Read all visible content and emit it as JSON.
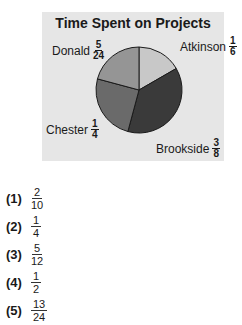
{
  "chart_data": {
    "type": "pie",
    "title": "Time Spent on Projects",
    "slices": [
      {
        "label": "Atkinson",
        "fraction": "1/6",
        "value": 0.1667,
        "color": "#c8c8c8"
      },
      {
        "label": "Brookside",
        "fraction": "3/8",
        "value": 0.375,
        "color": "#3a3a3a"
      },
      {
        "label": "Chester",
        "fraction": "1/4",
        "value": 0.25,
        "color": "#6a6a6a"
      },
      {
        "label": "Donald",
        "fraction": "5/24",
        "value": 0.2083,
        "color": "#959595"
      }
    ],
    "start_angle_deg": 0,
    "direction": "clockwise"
  },
  "labels": {
    "atkinson": {
      "name": "Atkinson",
      "num": "1",
      "den": "6"
    },
    "brookside": {
      "name": "Brookside",
      "num": "3",
      "den": "8"
    },
    "chester": {
      "name": "Chester",
      "num": "1",
      "den": "4"
    },
    "donald": {
      "name": "Donald",
      "num": "5",
      "den": "24"
    }
  },
  "choices": [
    {
      "marker": "(1)",
      "num": "2",
      "den": "10"
    },
    {
      "marker": "(2)",
      "num": "1",
      "den": "4"
    },
    {
      "marker": "(3)",
      "num": "5",
      "den": "12"
    },
    {
      "marker": "(4)",
      "num": "1",
      "den": "2"
    },
    {
      "marker": "(5)",
      "num": "13",
      "den": "24"
    }
  ]
}
